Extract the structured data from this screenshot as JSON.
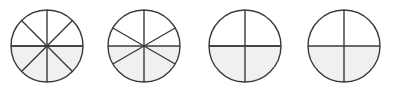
{
  "figure": {
    "name": "equivalent-fraction-circles",
    "background_color": "#ffffff",
    "stroke_color": "#3a3a3a",
    "shade_color": "#f0f0f0",
    "stroke_width": 1.4,
    "circle_count": 4
  },
  "chart_data": {
    "type": "pie",
    "title": "",
    "xlabel": "",
    "ylabel": "",
    "legend": [],
    "grid": false,
    "series": [
      {
        "name": "circle-eighths",
        "slices": 8,
        "shaded_slices": 4,
        "fraction": "4/8",
        "value": 0.5,
        "slice_angle_degrees": 45,
        "shaded_region": "bottom-half",
        "center_x": 47,
        "center_y": 46,
        "radius": 36
      },
      {
        "name": "circle-sixths",
        "slices": 6,
        "shaded_slices": 3,
        "fraction": "3/6",
        "value": 0.5,
        "slice_angle_degrees": 60,
        "shaded_region": "bottom-half",
        "center_x": 144,
        "center_y": 46,
        "radius": 36
      },
      {
        "name": "circle-fourths",
        "slices": 4,
        "shaded_slices": 2,
        "fraction": "2/4",
        "value": 0.5,
        "slice_angle_degrees": 90,
        "shaded_region": "bottom-half",
        "center_x": 245,
        "center_y": 46,
        "radius": 36
      },
      {
        "name": "circle-halves",
        "slices": 2,
        "shaded_slices": 1,
        "fraction": "1/2",
        "value": 0.5,
        "slice_angle_degrees": 180,
        "shaded_region": "bottom-half",
        "center_x": 344,
        "center_y": 46,
        "radius": 36
      }
    ]
  }
}
